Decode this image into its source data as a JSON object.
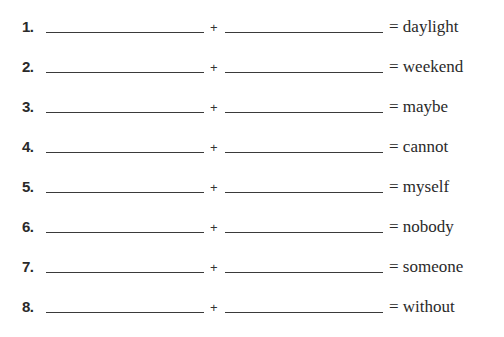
{
  "worksheet": {
    "plus_symbol": "+",
    "rows": [
      {
        "number": "1.",
        "result": "= daylight"
      },
      {
        "number": "2.",
        "result": "= weekend"
      },
      {
        "number": "3.",
        "result": "= maybe"
      },
      {
        "number": "4.",
        "result": "= cannot"
      },
      {
        "number": "5.",
        "result": "= myself"
      },
      {
        "number": "6.",
        "result": "= nobody"
      },
      {
        "number": "7.",
        "result": "= someone"
      },
      {
        "number": "8.",
        "result": "= without"
      }
    ]
  }
}
